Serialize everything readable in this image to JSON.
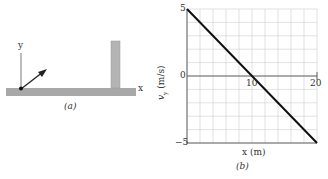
{
  "panel_a": {
    "caption": "(a)",
    "y_axis_label": "y",
    "x_axis_label": "x",
    "colors": {
      "floor": "#a8a8a8",
      "wall": "#b4b4b4",
      "arrow": "#222222"
    }
  },
  "panel_b": {
    "caption": "(b)",
    "xlabel": "x (m)",
    "ylabel": "v_y (m/s)",
    "ylabel_main": "v",
    "ylabel_sub": "y",
    "ylabel_unit": " (m/s)",
    "y_ticks": [
      "5",
      "0",
      "−5"
    ],
    "x_ticks": [
      "10",
      "20"
    ]
  },
  "chart_data": {
    "type": "line",
    "title": "",
    "xlabel": "x (m)",
    "ylabel": "v_y (m/s)",
    "xlim": [
      0,
      20
    ],
    "ylim": [
      -5,
      5
    ],
    "grid": true,
    "grid_x_step": 2,
    "grid_y_step": 1,
    "x_tick_labels": [
      "10",
      "20"
    ],
    "y_tick_labels": [
      "5",
      "0",
      "-5"
    ],
    "series": [
      {
        "name": "v_y",
        "x": [
          0,
          10,
          20
        ],
        "values": [
          5,
          0,
          -5
        ]
      }
    ]
  }
}
